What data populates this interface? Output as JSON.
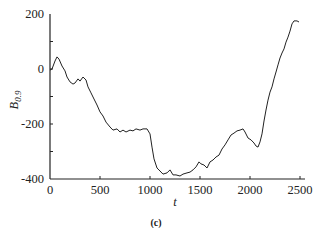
{
  "chart_data": {
    "type": "line",
    "title": "",
    "panel_label": "(c)",
    "xlabel": "t",
    "ylabel": "B",
    "ylabel_subscript": "0.9",
    "xlim": [
      0,
      2500
    ],
    "ylim": [
      -400,
      200
    ],
    "xticks": [
      0,
      500,
      1000,
      1500,
      2000,
      2500
    ],
    "xtick_labels": [
      "0",
      "500",
      "1000",
      "1500",
      "2000",
      "2500"
    ],
    "yticks": [
      200,
      100,
      0,
      -100,
      -200,
      -300,
      -400
    ],
    "ytick_labels": [
      "200",
      "",
      "0",
      "",
      "-200",
      "",
      "-400"
    ],
    "grid": false,
    "legend": null,
    "line_color": "#222222",
    "series": [
      {
        "name": "B_0.9",
        "x": [
          0,
          20,
          50,
          70,
          90,
          120,
          150,
          170,
          200,
          230,
          250,
          280,
          300,
          330,
          360,
          380,
          410,
          440,
          470,
          500,
          530,
          560,
          600,
          630,
          670,
          700,
          730,
          760,
          800,
          830,
          860,
          900,
          930,
          970,
          1000,
          1020,
          1040,
          1070,
          1100,
          1130,
          1170,
          1200,
          1230,
          1260,
          1300,
          1330,
          1370,
          1400,
          1430,
          1460,
          1490,
          1510,
          1540,
          1570,
          1600,
          1630,
          1660,
          1690,
          1720,
          1750,
          1780,
          1810,
          1840,
          1870,
          1900,
          1930,
          1950,
          1980,
          2010,
          2040,
          2060,
          2080,
          2100,
          2120,
          2140,
          2160,
          2180,
          2200,
          2220,
          2240,
          2260,
          2280,
          2300,
          2320,
          2340,
          2360,
          2380,
          2400,
          2420,
          2440,
          2470,
          2490
        ],
        "y": [
          -4,
          0,
          29,
          44,
          36,
          11,
          -7,
          -29,
          -47,
          -55,
          -51,
          -36,
          -44,
          -29,
          -40,
          -65,
          -87,
          -109,
          -131,
          -156,
          -171,
          -193,
          -211,
          -222,
          -218,
          -229,
          -222,
          -229,
          -222,
          -225,
          -218,
          -222,
          -218,
          -218,
          -236,
          -284,
          -327,
          -360,
          -371,
          -382,
          -378,
          -367,
          -385,
          -385,
          -389,
          -382,
          -378,
          -375,
          -367,
          -356,
          -338,
          -345,
          -349,
          -360,
          -338,
          -331,
          -320,
          -313,
          -291,
          -276,
          -258,
          -240,
          -233,
          -225,
          -222,
          -218,
          -229,
          -251,
          -258,
          -269,
          -280,
          -284,
          -265,
          -236,
          -189,
          -149,
          -113,
          -84,
          -65,
          -36,
          -11,
          15,
          40,
          58,
          73,
          98,
          116,
          138,
          164,
          175,
          175,
          171
        ]
      }
    ]
  }
}
